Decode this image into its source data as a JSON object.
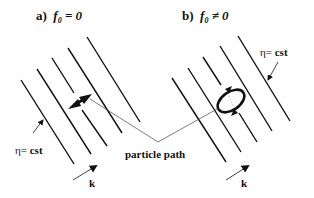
{
  "panels": [
    {
      "id": "a",
      "label": "a)",
      "condition_var": "f",
      "condition_sub": "0",
      "condition_op": "= 0",
      "motion": "linear oscillation (double-headed arrow)"
    },
    {
      "id": "b",
      "label": "b)",
      "condition_var": "f",
      "condition_sub": "0",
      "condition_op": "≠ 0",
      "motion": "elliptical orbit (closed loop with arrows)"
    }
  ],
  "labels": {
    "eta_symbol": "η=",
    "eta_value": "cst",
    "particle_path": "particle path",
    "wave_vector": "k"
  },
  "colors": {
    "line": "#111111",
    "thin_line": "#444444",
    "background": "#ffffff"
  }
}
